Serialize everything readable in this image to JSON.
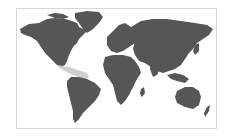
{
  "map": {
    "type": "world-map",
    "projection": "equirectangular-style",
    "colors": {
      "land": "#565656",
      "highlight": "#cfcfcf",
      "ocean": "#ffffff",
      "frame_border": "#d6d6d6"
    },
    "highlighted_region": "Central America and Caribbean",
    "regions": [
      "North America",
      "Greenland",
      "South America",
      "Europe",
      "Africa",
      "Asia",
      "Australia",
      "New Zealand",
      "Central America and Caribbean"
    ]
  }
}
